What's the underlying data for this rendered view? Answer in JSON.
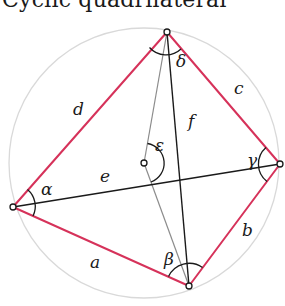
{
  "title": "Cyclic quadrilateral",
  "colors": {
    "sides": "#d6325a",
    "diagonals": "#1a1a1a",
    "radii": "#8c8c8c",
    "circle": "#d9d9d9"
  },
  "circle": {
    "cx": 144,
    "cy": 163,
    "r": 135
  },
  "vertices": {
    "A": {
      "x": 13,
      "y": 207
    },
    "B": {
      "x": 189,
      "y": 286
    },
    "C": {
      "x": 280,
      "y": 164
    },
    "D": {
      "x": 167,
      "y": 32
    },
    "O": {
      "x": 144,
      "y": 163
    }
  },
  "labels": {
    "side_a": "a",
    "side_b": "b",
    "side_c": "c",
    "side_d": "d",
    "diag_e": "e",
    "diag_f": "f",
    "angle_alpha": "α",
    "angle_beta": "β",
    "angle_gamma": "γ",
    "angle_delta": "δ",
    "angle_epsilon": "ε"
  }
}
